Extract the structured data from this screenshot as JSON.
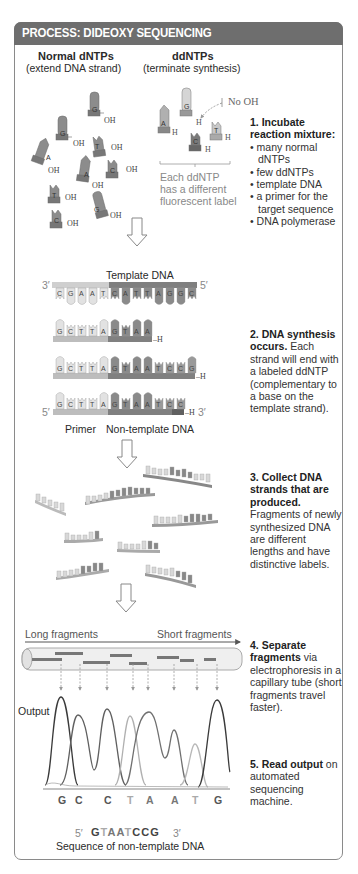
{
  "header": {
    "title": "PROCESS: DIDEOXY SEQUENCING"
  },
  "colors": {
    "header_bg": "#6e6e6e",
    "frame": "#8a8a8a",
    "dark_nt": "#7a7a7a",
    "light_nt": "#d4d4d4",
    "mid_nt": "#a8a8a8"
  },
  "panel1": {
    "normal_title": "Normal dNTPs",
    "normal_sub": "(extend DNA strand)",
    "dd_title": "ddNTPs",
    "dd_sub": "(terminate synthesis)",
    "no_oh_label": "No OH",
    "dd_note": [
      "Each ddNTP",
      "has a different",
      "fluorescent label"
    ],
    "normal_nucleotides": [
      "G",
      "G",
      "T",
      "A",
      "A",
      "C",
      "T",
      "C",
      "G"
    ],
    "dd_nucleotides": [
      "A",
      "G",
      "C",
      "T"
    ],
    "oh_label": "OH",
    "h_label": "H"
  },
  "steps": {
    "s1": {
      "title": "1. Incubate reaction mixture:",
      "items": [
        "many normal dNTPs",
        "few ddNTPs",
        "template DNA",
        "a primer for the target sequence",
        "DNA polymerase"
      ]
    },
    "s2": {
      "title": "2. DNA synthesis occurs.",
      "body": "Each strand will end with a labeled ddNTP (complementary to a base on the template strand)."
    },
    "s3": {
      "title": "3. Collect DNA strands that are produced.",
      "body": "Fragments of newly synthesized DNA are different lengths and have distinctive labels."
    },
    "s4": {
      "title": "4. Separate fragments",
      "body": "via electrophoresis in a capillary tube (short fragments travel faster)."
    },
    "s5": {
      "title": "5. Read output",
      "body": "on automated sequencing machine."
    }
  },
  "panel2": {
    "template_label": "Template DNA",
    "template_3": "3′",
    "template_5": "5′",
    "template_seq": [
      "C",
      "G",
      "A",
      "A",
      "T",
      "C",
      "A",
      "T",
      "T",
      "A",
      "G",
      "G",
      "C"
    ],
    "strand1": [
      "G",
      "C",
      "T",
      "T",
      "A",
      "G",
      "T",
      "A",
      "A"
    ],
    "strand2": [
      "G",
      "C",
      "T",
      "T",
      "A",
      "G",
      "T",
      "A",
      "A",
      "T",
      "C",
      "C",
      "G"
    ],
    "strand3": [
      "G",
      "C",
      "T",
      "T",
      "A",
      "G",
      "T",
      "A",
      "A",
      "T",
      "C",
      "C"
    ],
    "end_h": "H",
    "five_prime": "5′",
    "three_prime": "3′",
    "primer_label": "Primer",
    "nontemplate_label": "Non-template DNA"
  },
  "panel4": {
    "long_label": "Long fragments",
    "short_label": "Short fragments"
  },
  "panel5": {
    "output_label": "Output",
    "bases": [
      "G",
      "C",
      "C",
      "T",
      "A",
      "A",
      "T",
      "G"
    ],
    "seq_5": "5′",
    "seq_3": "3′",
    "sequence": [
      "G",
      "T",
      "A",
      "A",
      "T",
      "C",
      "C",
      "G"
    ],
    "caption": "Sequence of non-template DNA"
  },
  "chart_data": {
    "type": "line",
    "title": "Output",
    "xlabel": "",
    "ylabel": "",
    "categories": [
      "G",
      "C",
      "C",
      "T",
      "A",
      "A",
      "T",
      "G"
    ],
    "peak_heights_relative": [
      1.0,
      0.82,
      0.8,
      0.76,
      0.8,
      0.6,
      0.45,
      0.93
    ],
    "grid": false
  }
}
